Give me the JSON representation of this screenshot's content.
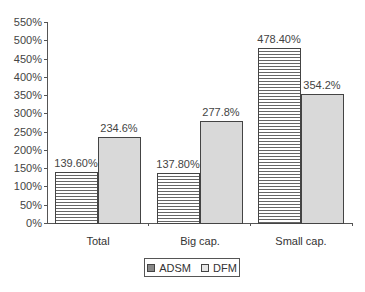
{
  "chart_data": {
    "type": "bar",
    "title": "",
    "xlabel": "",
    "ylabel": "",
    "categories": [
      "Total",
      "Big cap.",
      "Small cap."
    ],
    "series": [
      {
        "name": "ADSM",
        "values": [
          139.6,
          137.8,
          478.4
        ],
        "labels": [
          "139.60%",
          "137.80%",
          "478.40%"
        ],
        "pattern": "horizontal-lines"
      },
      {
        "name": "DFM",
        "values": [
          234.6,
          277.8,
          354.2
        ],
        "labels": [
          "234.6%",
          "277.8%",
          "354.2%"
        ],
        "pattern": "light-gray-fill"
      }
    ],
    "ylim": [
      0,
      550
    ],
    "yticks": [
      0,
      50,
      100,
      150,
      200,
      250,
      300,
      350,
      400,
      450,
      500,
      550
    ],
    "ytick_labels": [
      "0%",
      "50%",
      "100%",
      "150%",
      "200%",
      "250%",
      "300%",
      "350%",
      "400%",
      "450%",
      "500%",
      "550%"
    ],
    "grid": false,
    "legend_position": "bottom"
  },
  "legend": {
    "items": [
      {
        "label": "ADSM"
      },
      {
        "label": "DFM"
      }
    ]
  }
}
